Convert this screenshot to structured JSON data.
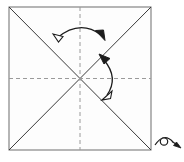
{
  "figure": {
    "name": "origami-fold-diagram",
    "title": "Origami square with diagonal creases and fold arrows",
    "canvas": {
      "width": 184,
      "height": 162
    },
    "background_color": "#ffffff"
  },
  "paper": {
    "name": "square-sheet",
    "shape": "square",
    "fill_color": "#fdfdfd",
    "edge_color": "#7a7a7a",
    "edge_width": 1.1,
    "corners": {
      "top_left": [
        9,
        7
      ],
      "top_right": [
        151,
        7
      ],
      "bottom_right": [
        151,
        150
      ],
      "bottom_left": [
        9,
        150
      ]
    },
    "center": [
      80,
      78.5
    ]
  },
  "creases": {
    "diagonals": {
      "name": "diagonal-creases",
      "style": "solid",
      "color": "#3a3a3a",
      "width": 1.0,
      "lines": [
        {
          "name": "diagonal-tl-br",
          "from": [
            9,
            7
          ],
          "to": [
            151,
            150
          ]
        },
        {
          "name": "diagonal-tr-bl",
          "from": [
            151,
            7
          ],
          "to": [
            9,
            150
          ]
        }
      ]
    },
    "midlines": {
      "name": "midline-creases",
      "style": "dashed",
      "color": "#9a9a9a",
      "width": 1.0,
      "dash": "4,3",
      "lines": [
        {
          "name": "midline-vertical",
          "from": [
            80,
            7
          ],
          "to": [
            80,
            150
          ]
        },
        {
          "name": "midline-horizontal",
          "from": [
            9,
            78.5
          ],
          "to": [
            151,
            78.5
          ]
        }
      ]
    }
  },
  "arrows": [
    {
      "name": "fold-arrow-top",
      "label": "valley fold arrow, top",
      "type": "double-headed-curved",
      "color": "#1c1c1c",
      "width": 1.3,
      "path": "M 55 39 Q 80 19 103 36",
      "head_start": {
        "style": "hollow",
        "at": [
          55,
          39
        ],
        "angle": -140
      },
      "head_end": {
        "style": "solid",
        "at": [
          103,
          36
        ],
        "angle": 45
      }
    },
    {
      "name": "fold-arrow-right",
      "label": "valley fold arrow, right",
      "type": "double-headed-curved",
      "color": "#1c1c1c",
      "width": 1.3,
      "path": "M 102 57 Q 118 78 105 97",
      "head_start": {
        "style": "solid",
        "at": [
          102,
          57
        ],
        "angle": -128
      },
      "head_end": {
        "style": "hollow",
        "at": [
          105,
          97
        ],
        "angle": 132
      }
    }
  ],
  "view_indicator": {
    "name": "eye-view-symbol",
    "label": "eye symbol indicating viewing direction",
    "color": "#1c1c1c",
    "position": [
      168,
      142
    ],
    "eye_path": "M 155 144 Q 164 133 173 142",
    "pupil": {
      "cx": 164,
      "cy": 141.5,
      "r": 3.6
    },
    "sight_line": {
      "from": [
        172,
        142
      ],
      "to": [
        180,
        147
      ]
    },
    "sight_arrow_head": {
      "at": [
        180,
        147
      ],
      "angle": 32,
      "style": "solid"
    }
  }
}
